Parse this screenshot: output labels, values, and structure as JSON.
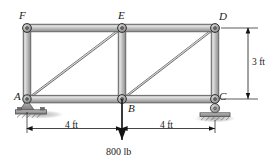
{
  "figure": {
    "type": "plane-truss-free-body-diagram",
    "joint_labels": [
      {
        "id": "F",
        "text": "F",
        "x": 27,
        "y": 28,
        "label_x": 19,
        "label_y": 10
      },
      {
        "id": "E",
        "text": "E",
        "x": 122,
        "y": 28,
        "label_x": 118,
        "label_y": 10
      },
      {
        "id": "D",
        "text": "D",
        "x": 215,
        "y": 28,
        "label_x": 219,
        "label_y": 11
      },
      {
        "id": "A",
        "text": "A",
        "x": 27,
        "y": 99,
        "label_x": 14,
        "label_y": 91
      },
      {
        "id": "B",
        "text": "B",
        "x": 122,
        "y": 99,
        "label_x": 128,
        "label_y": 103
      },
      {
        "id": "C",
        "text": "C",
        "x": 215,
        "y": 99,
        "label_x": 219,
        "label_y": 91
      }
    ],
    "members": [
      {
        "from": "F",
        "to": "E",
        "kind": "top-chord"
      },
      {
        "from": "E",
        "to": "D",
        "kind": "top-chord"
      },
      {
        "from": "A",
        "to": "B",
        "kind": "bottom-chord"
      },
      {
        "from": "B",
        "to": "C",
        "kind": "bottom-chord"
      },
      {
        "from": "F",
        "to": "A",
        "kind": "vertical"
      },
      {
        "from": "E",
        "to": "B",
        "kind": "vertical"
      },
      {
        "from": "D",
        "to": "C",
        "kind": "vertical"
      },
      {
        "from": "A",
        "to": "E",
        "kind": "diagonal"
      },
      {
        "from": "B",
        "to": "D",
        "kind": "diagonal"
      }
    ],
    "supports": [
      {
        "at": "A",
        "type": "pin-support"
      },
      {
        "at": "C",
        "type": "roller-support"
      }
    ],
    "load": {
      "at": "B",
      "magnitude": "800 lb",
      "direction": "down",
      "label_x": 107,
      "label_y": 149
    },
    "dimensions": [
      {
        "id": "span-left",
        "text": "4 ft",
        "orientation": "horizontal",
        "from": "A",
        "to": "B",
        "label_x": 65,
        "label_y": 121
      },
      {
        "id": "span-right",
        "text": "4 ft",
        "orientation": "horizontal",
        "from": "B",
        "to": "C",
        "label_x": 160,
        "label_y": 121
      },
      {
        "id": "height-right",
        "text": "3 ft",
        "orientation": "vertical",
        "from": "D",
        "to": "C",
        "label_x": 242,
        "label_y": 59
      }
    ],
    "colors": {
      "member_fill": "#b9b9b9",
      "member_highlight": "#e2e2e2",
      "member_edge": "#5d5d5d",
      "joint_pin": "#9a9a9a",
      "joint_edge": "#3b3b3b",
      "support_fill": "#a8a8a8",
      "ground_fill": "#8e8e8e",
      "line": "#1a1a1a",
      "background": "#ffffff"
    }
  }
}
